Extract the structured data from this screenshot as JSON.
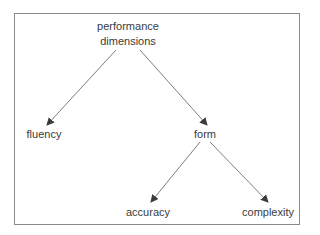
{
  "diagram": {
    "type": "tree",
    "nodes": {
      "root": {
        "line1": "performance",
        "line2": "dimensions"
      },
      "fluency": {
        "label": "fluency"
      },
      "form": {
        "label": "form"
      },
      "accuracy": {
        "label": "accuracy"
      },
      "complexity": {
        "label": "complexity"
      }
    },
    "edges": [
      {
        "from": "performance dimensions",
        "to": "fluency"
      },
      {
        "from": "performance dimensions",
        "to": "form"
      },
      {
        "from": "form",
        "to": "accuracy"
      },
      {
        "from": "form",
        "to": "complexity"
      }
    ],
    "colors": {
      "line": "#6e6e6e",
      "text": "#3a3a3a",
      "frame": "#8a8a8a"
    }
  }
}
